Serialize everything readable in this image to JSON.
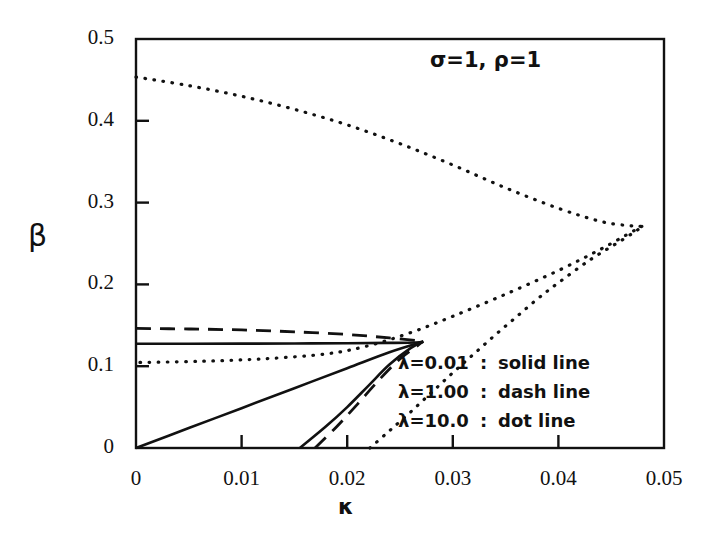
{
  "chart_data": {
    "type": "line",
    "title": "",
    "xlabel": "κ",
    "ylabel": "β",
    "xlim": [
      0,
      0.05
    ],
    "ylim": [
      0,
      0.5
    ],
    "grid": false,
    "xticks": [
      "0",
      "0.01",
      "0.02",
      "0.03",
      "0.04",
      "0.05"
    ],
    "xtick_values": [
      0,
      0.01,
      0.02,
      0.03,
      0.04,
      0.05
    ],
    "yticks": [
      "0",
      "0.1",
      "0.2",
      "0.3",
      "0.4",
      "0.5"
    ],
    "ytick_values": [
      0,
      0.1,
      0.2,
      0.3,
      0.4,
      0.5
    ],
    "annotation": "σ=1, ρ=1",
    "legend_position": "lower-right",
    "legend": [
      {
        "label": "λ=0.01",
        "sep": ":",
        "style": "solid line"
      },
      {
        "label": "λ=1.00",
        "sep": ":",
        "style": "dash line"
      },
      {
        "label": "λ=10.0",
        "sep": ":",
        "style": "dot line"
      }
    ],
    "series": [
      {
        "name": "λ=0.01 upper branch",
        "style": "solid",
        "points": [
          [
            0.0,
            0.1275
          ],
          [
            0.005,
            0.1275
          ],
          [
            0.01,
            0.1276
          ],
          [
            0.015,
            0.1278
          ],
          [
            0.02,
            0.1281
          ],
          [
            0.024,
            0.1285
          ],
          [
            0.0265,
            0.129
          ],
          [
            0.0272,
            0.13
          ]
        ]
      },
      {
        "name": "λ=0.01 lower branch from origin",
        "style": "solid",
        "points": [
          [
            0.0,
            0.0
          ],
          [
            0.005,
            0.0244
          ],
          [
            0.01,
            0.0487
          ],
          [
            0.015,
            0.0731
          ],
          [
            0.02,
            0.0975
          ],
          [
            0.024,
            0.117
          ],
          [
            0.0272,
            0.13
          ]
        ]
      },
      {
        "name": "λ=0.01 steep branch",
        "style": "solid",
        "points": [
          [
            0.01552,
            0.0
          ],
          [
            0.018,
            0.0265
          ],
          [
            0.02,
            0.05
          ],
          [
            0.022,
            0.076
          ],
          [
            0.024,
            0.102
          ],
          [
            0.026,
            0.122
          ],
          [
            0.0272,
            0.13
          ]
        ]
      },
      {
        "name": "λ=1.00 upper branch",
        "style": "dash",
        "points": [
          [
            0.0,
            0.1462
          ],
          [
            0.005,
            0.1455
          ],
          [
            0.01,
            0.1443
          ],
          [
            0.015,
            0.142
          ],
          [
            0.02,
            0.1388
          ],
          [
            0.024,
            0.1345
          ],
          [
            0.0272,
            0.1305
          ]
        ]
      },
      {
        "name": "λ=1.00 lower branch",
        "style": "dash",
        "points": [
          [
            0.01695,
            0.0
          ],
          [
            0.019,
            0.026
          ],
          [
            0.021,
            0.054
          ],
          [
            0.023,
            0.083
          ],
          [
            0.025,
            0.109
          ],
          [
            0.0265,
            0.1235
          ],
          [
            0.0272,
            0.1305
          ]
        ]
      },
      {
        "name": "λ=10.0 upper branch",
        "style": "dot",
        "points": [
          [
            0.0,
            0.4535
          ],
          [
            0.005,
            0.443
          ],
          [
            0.01,
            0.43
          ],
          [
            0.015,
            0.414
          ],
          [
            0.02,
            0.395
          ],
          [
            0.025,
            0.372
          ],
          [
            0.03,
            0.346
          ],
          [
            0.035,
            0.318
          ],
          [
            0.04,
            0.293
          ],
          [
            0.044,
            0.277
          ],
          [
            0.0465,
            0.272
          ],
          [
            0.0479,
            0.271
          ]
        ]
      },
      {
        "name": "λ=10.0 lower branch",
        "style": "dot",
        "points": [
          [
            0.0479,
            0.271
          ],
          [
            0.0465,
            0.261
          ],
          [
            0.044,
            0.243
          ],
          [
            0.04,
            0.217
          ],
          [
            0.035,
            0.188
          ],
          [
            0.03,
            0.161
          ],
          [
            0.026,
            0.141
          ],
          [
            0.022,
            0.125
          ],
          [
            0.018,
            0.115
          ],
          [
            0.012,
            0.109
          ],
          [
            0.006,
            0.106
          ],
          [
            0.0,
            0.1045
          ]
        ]
      },
      {
        "name": "λ=10.0 rising branch",
        "style": "dot",
        "points": [
          [
            0.02215,
            0.0
          ],
          [
            0.024,
            0.021
          ],
          [
            0.026,
            0.044
          ],
          [
            0.028,
            0.068
          ],
          [
            0.03,
            0.092
          ],
          [
            0.032,
            0.115
          ],
          [
            0.034,
            0.138
          ],
          [
            0.036,
            0.16
          ],
          [
            0.038,
            0.182
          ],
          [
            0.04,
            0.202
          ],
          [
            0.043,
            0.23
          ],
          [
            0.046,
            0.254
          ],
          [
            0.0479,
            0.27
          ]
        ]
      }
    ]
  }
}
